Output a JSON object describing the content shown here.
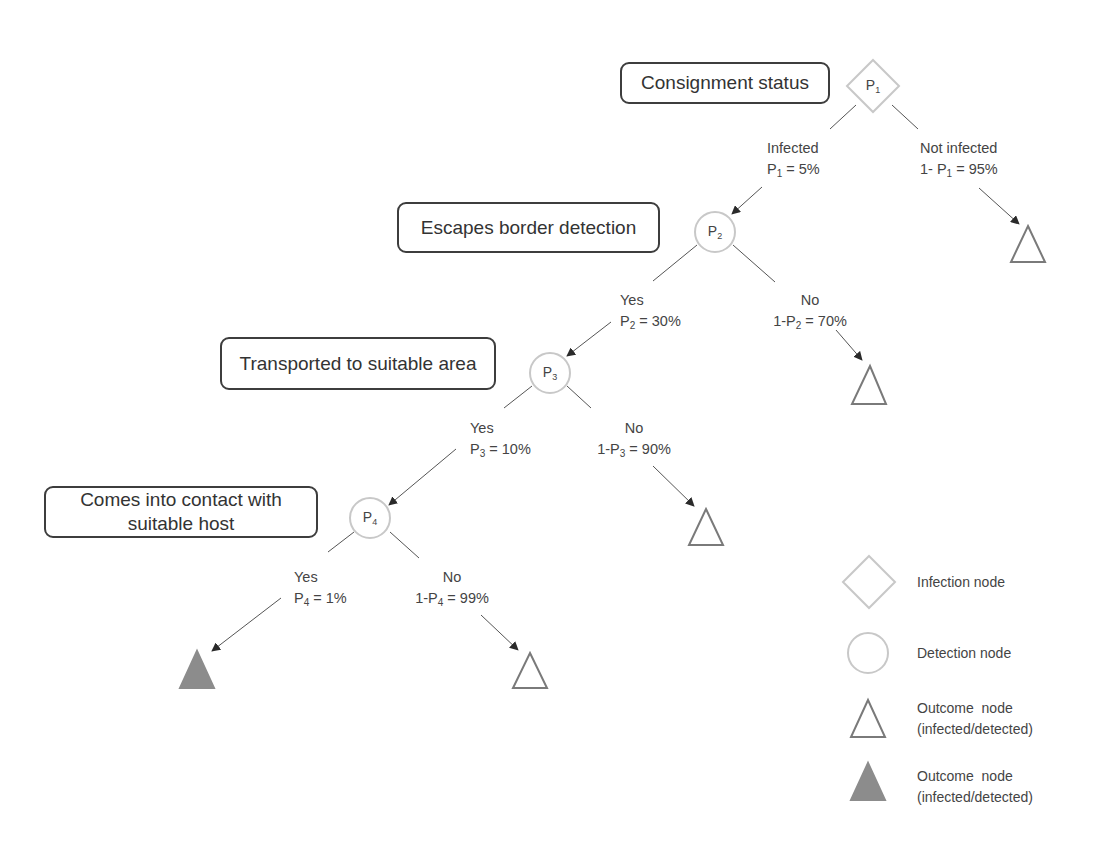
{
  "diagram": {
    "type": "probability-decision-tree",
    "steps": [
      {
        "id": "step1",
        "label": "Consignment status",
        "node": "P1",
        "node_type": "infection"
      },
      {
        "id": "step2",
        "label": "Escapes border detection",
        "node": "P2",
        "node_type": "detection"
      },
      {
        "id": "step3",
        "label": "Transported to suitable area",
        "node": "P3",
        "node_type": "detection"
      },
      {
        "id": "step4",
        "label_line1": "Comes into contact with",
        "label_line2": "suitable host",
        "node": "P4",
        "node_type": "detection"
      }
    ],
    "nodes": {
      "p1": {
        "base": "P",
        "sub": "1"
      },
      "p2": {
        "base": "P",
        "sub": "2"
      },
      "p3": {
        "base": "P",
        "sub": "3"
      },
      "p4": {
        "base": "P",
        "sub": "4"
      }
    },
    "branches": {
      "p1_yes": {
        "line1": "Infected",
        "prefix": "P",
        "sub": "1",
        "suffix": " = 5%"
      },
      "p1_no": {
        "line1": "Not infected",
        "prefix": "1- P",
        "sub": "1",
        "suffix": " = 95%"
      },
      "p2_yes": {
        "line1": "Yes",
        "prefix": "P",
        "sub": "2",
        "suffix": " = 30%"
      },
      "p2_no": {
        "line1": "No",
        "prefix": "1-P",
        "sub": "2",
        "suffix": " = 70%"
      },
      "p3_yes": {
        "line1": "Yes",
        "prefix": "P",
        "sub": "3",
        "suffix": " = 10%"
      },
      "p3_no": {
        "line1": "No",
        "prefix": "1-P",
        "sub": "3",
        "suffix": " = 90%"
      },
      "p4_yes": {
        "line1": "Yes",
        "prefix": "P",
        "sub": "4",
        "suffix": " = 1%"
      },
      "p4_no": {
        "line1": "No",
        "prefix": "1-P",
        "sub": "4",
        "suffix": " = 99%"
      }
    },
    "probabilities": {
      "P1": "5%",
      "P2": "30%",
      "P3": "10%",
      "P4": "1%"
    },
    "outcomes": [
      {
        "from": "P1",
        "branch": "Not infected",
        "filled": false
      },
      {
        "from": "P2",
        "branch": "No",
        "filled": false
      },
      {
        "from": "P3",
        "branch": "No",
        "filled": false
      },
      {
        "from": "P4",
        "branch": "Yes",
        "filled": true
      },
      {
        "from": "P4",
        "branch": "No",
        "filled": false
      }
    ],
    "colors": {
      "box_border": "#3d3d3d",
      "node_outline": "#c8c8c8",
      "outcome_outline": "#7a7a7a",
      "outcome_fill": "#8c8c8c",
      "connector": "#555555",
      "arrowhead": "#2a2a2a"
    }
  },
  "legend": {
    "items": [
      {
        "icon": "diamond-icon",
        "label": "Infection node"
      },
      {
        "icon": "circle-icon",
        "label": "Detection node"
      },
      {
        "icon": "hollow-triangle-icon",
        "label_line1": "Outcome  node",
        "label_line2": "(infected/detected)"
      },
      {
        "icon": "filled-triangle-icon",
        "label_line1": "Outcome  node",
        "label_line2": "(infected/detected)"
      }
    ]
  }
}
